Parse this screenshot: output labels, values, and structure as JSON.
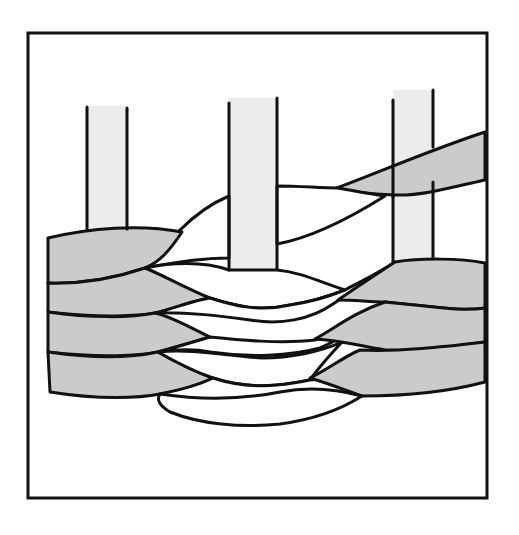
{
  "diagram": {
    "title": "",
    "colors": {
      "background": "#ffffff",
      "frame": "#111111",
      "gray_layer": "#cbcbcb",
      "white_layer": "#ffffff",
      "pillar_fill": "#ececec",
      "outline": "#111111"
    },
    "elements": {
      "frame": "outer-frame",
      "pillars": [
        "pillar-left",
        "pillar-center",
        "pillar-right"
      ],
      "gray_lenses_left": 4,
      "gray_lenses_right": 4,
      "gray_lens_top_right": 1,
      "white_lenses_center": 6
    }
  }
}
